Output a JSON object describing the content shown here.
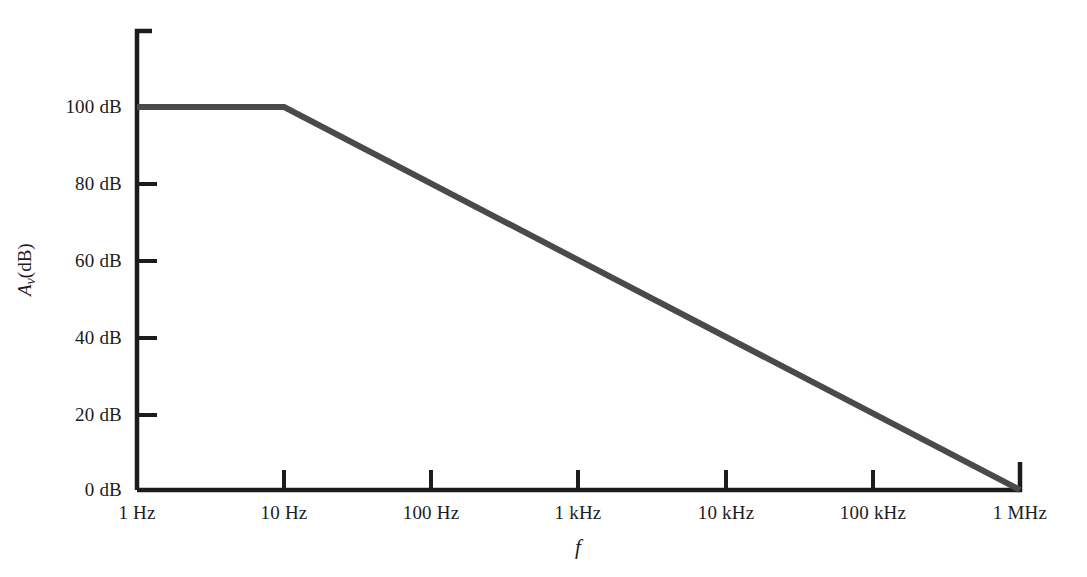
{
  "chart_data": {
    "type": "line",
    "title": "",
    "xlabel": "f",
    "ylabel": "Av(dB)",
    "xscale": "log",
    "grid": false,
    "legend": null,
    "xlim": [
      1,
      1000000
    ],
    "ylim": [
      0,
      110
    ],
    "x_tick_labels": [
      "1 Hz",
      "10 Hz",
      "100 Hz",
      "1 kHz",
      "10 kHz",
      "100 kHz",
      "1 MHz"
    ],
    "x_tick_values": [
      1,
      10,
      100,
      1000,
      10000,
      100000,
      1000000
    ],
    "y_tick_labels": [
      "0 dB",
      "20 dB",
      "40 dB",
      "60 dB",
      "80 dB",
      "100 dB"
    ],
    "y_tick_values": [
      0,
      20,
      40,
      60,
      80,
      100
    ],
    "series": [
      {
        "name": "open-loop voltage gain",
        "color": "#4a4a4a",
        "points": [
          {
            "x": 1,
            "y": 100
          },
          {
            "x": 10,
            "y": 100
          },
          {
            "x": 1000000,
            "y": 0
          }
        ]
      }
    ],
    "annotations": []
  },
  "axes": {
    "x_title": "f",
    "y_title_var": "A",
    "y_title_sub": "v",
    "y_title_unit": "(dB)"
  },
  "colors": {
    "axis": "#1c1c1c",
    "curve": "#4a4a4a",
    "background": "#ffffff",
    "text": "#1c1c1c"
  }
}
